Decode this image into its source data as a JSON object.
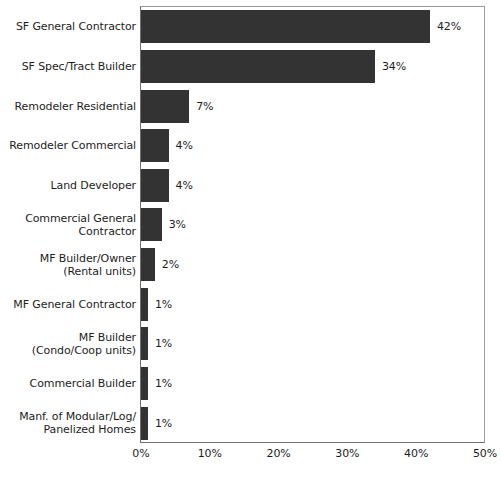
{
  "chart_data": {
    "type": "bar",
    "orientation": "horizontal",
    "title": "",
    "xlabel": "",
    "ylabel": "",
    "xlim": [
      0,
      50
    ],
    "xticks": [
      "0%",
      "10%",
      "20%",
      "30%",
      "40%",
      "50%"
    ],
    "xtick_values": [
      0,
      10,
      20,
      30,
      40,
      50
    ],
    "grid": false,
    "legend": false,
    "bar_color": "#333333",
    "categories": [
      "SF General Contractor",
      "SF Spec/Tract Builder",
      "Remodeler Residential",
      "Remodeler Commercial",
      "Land Developer",
      "Commercial General\nContractor",
      "MF Builder/Owner\n(Rental units)",
      "MF General Contractor",
      "MF Builder\n(Condo/Coop units)",
      "Commercial Builder",
      "Manf. of Modular/Log/\nPanelized Homes"
    ],
    "values": [
      42,
      34,
      7,
      4,
      4,
      3,
      2,
      1,
      1,
      1,
      1
    ],
    "value_labels": [
      "42%",
      "34%",
      "7%",
      "4%",
      "4%",
      "3%",
      "2%",
      "1%",
      "1%",
      "1%",
      "1%"
    ]
  }
}
